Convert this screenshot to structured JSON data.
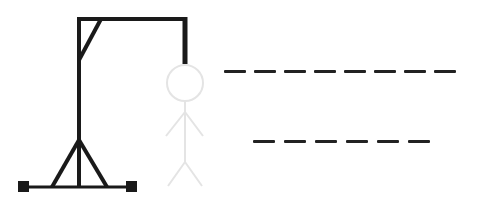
{
  "game": {
    "type": "hangman",
    "colors": {
      "gallows": "#1a1a1a",
      "figure": "#e6e6e6",
      "dash": "#222222",
      "background": "#ffffff"
    },
    "gallows": {
      "base_y": 186,
      "base_x1": 24,
      "base_x2": 132,
      "post_x": 79,
      "top_y": 19,
      "beam_x2": 185,
      "rope_y2": 63,
      "brace": {
        "x1": 101,
        "y1": 19,
        "x2": 79,
        "y2": 60
      },
      "legs": {
        "apex_y": 140,
        "left_x": 52,
        "right_x": 108
      },
      "feet": [
        {
          "x": 18,
          "y": 180
        },
        {
          "x": 126,
          "y": 180
        }
      ]
    },
    "figure": {
      "head": {
        "cx": 185,
        "cy": 83,
        "r": 18
      },
      "body": {
        "x": 185,
        "y1": 101,
        "y2": 162
      },
      "arms": {
        "y_shoulder": 112,
        "left": {
          "x": 166,
          "y": 136
        },
        "right": {
          "x": 203,
          "y": 136
        }
      },
      "legs": {
        "y_hip": 162,
        "left": {
          "x": 168,
          "y": 186
        },
        "right": {
          "x": 202,
          "y": 186
        }
      }
    },
    "words": [
      {
        "length": 8,
        "letters": [
          "",
          "",
          "",
          "",
          "",
          "",
          "",
          ""
        ]
      },
      {
        "length": 6,
        "letters": [
          "",
          "",
          "",
          "",
          "",
          ""
        ]
      }
    ]
  }
}
